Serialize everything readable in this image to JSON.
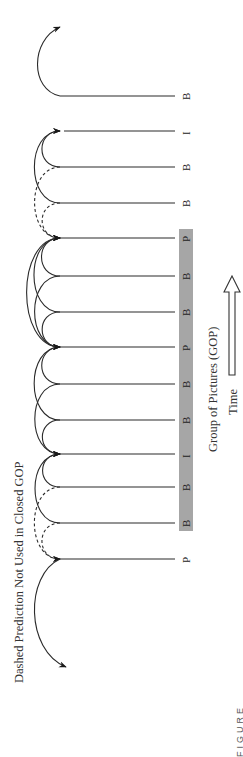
{
  "figure": {
    "title": "Dashed Prediction Not Used in Closed GOP",
    "gop_label": "Group of Pictures (GOP)",
    "time_label": "Time",
    "figure_label": "FIGURE",
    "orientation": "rotated-90-ccw",
    "colors": {
      "line": "#2a2a2a",
      "gop_bar": "#a6a6a6",
      "background": "#ffffff"
    }
  },
  "frames": [
    {
      "type": "B",
      "y": 96,
      "in_gop": false
    },
    {
      "type": "I",
      "y": 131,
      "in_gop": false
    },
    {
      "type": "B",
      "y": 167,
      "in_gop": false
    },
    {
      "type": "B",
      "y": 203,
      "in_gop": false
    },
    {
      "type": "P",
      "y": 238,
      "in_gop": true
    },
    {
      "type": "B",
      "y": 276,
      "in_gop": true
    },
    {
      "type": "B",
      "y": 312,
      "in_gop": true
    },
    {
      "type": "P",
      "y": 347,
      "in_gop": true
    },
    {
      "type": "B",
      "y": 384,
      "in_gop": true
    },
    {
      "type": "B",
      "y": 420,
      "in_gop": true
    },
    {
      "type": "I",
      "y": 454,
      "in_gop": true
    },
    {
      "type": "B",
      "y": 487,
      "in_gop": true
    },
    {
      "type": "B",
      "y": 523,
      "in_gop": true
    },
    {
      "type": "P",
      "y": 559,
      "in_gop": false
    }
  ],
  "predictions": [
    {
      "from": 2,
      "to": 1,
      "dashed": false
    },
    {
      "from": 3,
      "to": 1,
      "dashed": false
    },
    {
      "from": 2,
      "to": 4,
      "dashed": true
    },
    {
      "from": 3,
      "to": 4,
      "dashed": true
    },
    {
      "from": 5,
      "to": 4,
      "dashed": false
    },
    {
      "from": 6,
      "to": 4,
      "dashed": false
    },
    {
      "from": 5,
      "to": 7,
      "dashed": false
    },
    {
      "from": 6,
      "to": 7,
      "dashed": false
    },
    {
      "from": 7,
      "to": 4,
      "dashed": false
    },
    {
      "from": 8,
      "to": 7,
      "dashed": false
    },
    {
      "from": 9,
      "to": 7,
      "dashed": false
    },
    {
      "from": 8,
      "to": 10,
      "dashed": false
    },
    {
      "from": 9,
      "to": 10,
      "dashed": false
    },
    {
      "from": 11,
      "to": 10,
      "dashed": false
    },
    {
      "from": 12,
      "to": 10,
      "dashed": false
    },
    {
      "from": 11,
      "to": 13,
      "dashed": true
    },
    {
      "from": 12,
      "to": 13,
      "dashed": true
    }
  ]
}
